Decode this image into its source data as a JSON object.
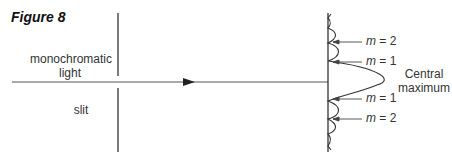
{
  "figure": {
    "title": "Figure 8",
    "labels": {
      "light": "monochromatic light",
      "light_line1": "monochromatic",
      "light_line2": "light",
      "slit": "slit",
      "central_line1": "Central",
      "central_line2": "maximum"
    },
    "orders": [
      {
        "m_var": "m",
        "eq": " = 2"
      },
      {
        "m_var": "m",
        "eq": " = 1"
      },
      {
        "m_var": "m",
        "eq": " = 1"
      },
      {
        "m_var": "m",
        "eq": " = 2"
      }
    ],
    "colors": {
      "line": "#333333",
      "text": "#333333"
    }
  }
}
